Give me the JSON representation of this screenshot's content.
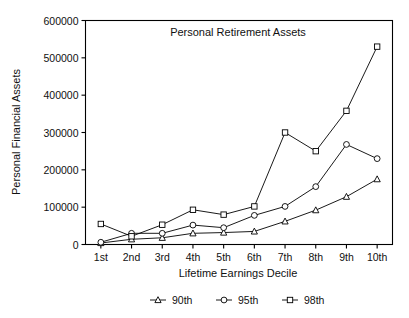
{
  "chart_data": {
    "type": "line",
    "title": "Personal Retirement Assets",
    "xlabel": "Lifetime Earnings Decile",
    "ylabel": "Personal Financial Assets",
    "categories": [
      "1st",
      "2nd",
      "3rd",
      "4th",
      "5th",
      "6th",
      "7th",
      "8th",
      "9th",
      "10th"
    ],
    "ylim": [
      0,
      600000
    ],
    "yticks": [
      0,
      100000,
      200000,
      300000,
      400000,
      500000,
      600000
    ],
    "yticklabels": [
      "0",
      "100000",
      "200000",
      "300000",
      "400000",
      "500000",
      "600000"
    ],
    "grid": false,
    "legend_position": "bottom",
    "series": [
      {
        "name": "90th",
        "marker": "triangle",
        "values": [
          4000,
          14000,
          18000,
          30000,
          32000,
          35000,
          62000,
          92000,
          128000,
          175000
        ]
      },
      {
        "name": "95th",
        "marker": "circle",
        "values": [
          6000,
          30000,
          30000,
          52000,
          45000,
          78000,
          102000,
          155000,
          268000,
          230000
        ]
      },
      {
        "name": "98th",
        "marker": "square",
        "values": [
          55000,
          22000,
          53000,
          93000,
          80000,
          102000,
          300000,
          250000,
          358000,
          530000
        ]
      }
    ]
  },
  "figure": {
    "title": "Personal Retirement Assets",
    "xlabel": "Lifetime Earnings Decile",
    "ylabel": "Personal Financial Assets"
  },
  "legend": {
    "items": [
      {
        "label": "90th",
        "marker": "triangle-marker"
      },
      {
        "label": "95th",
        "marker": "circle-marker"
      },
      {
        "label": "98th",
        "marker": "square-marker"
      }
    ]
  }
}
